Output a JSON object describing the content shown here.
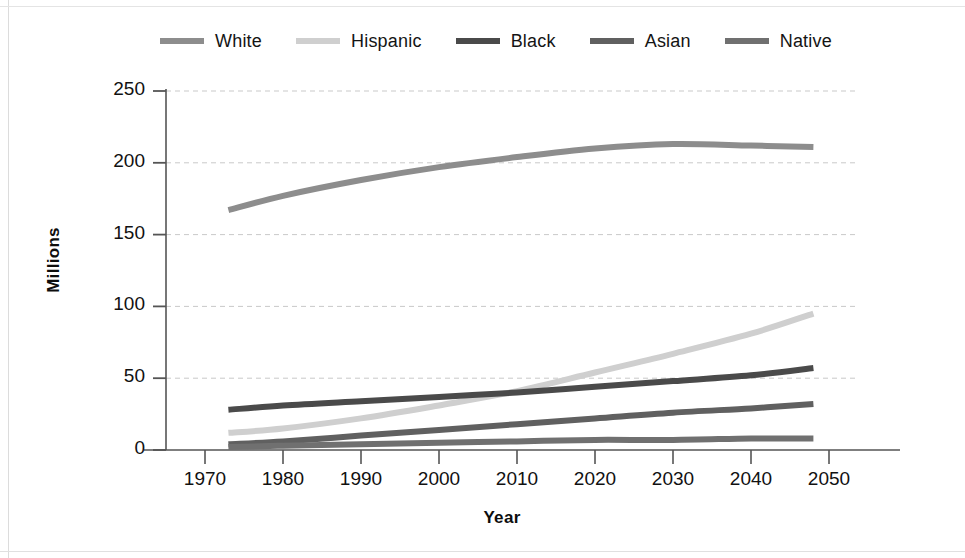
{
  "chart_data": {
    "type": "line",
    "title": "",
    "xlabel": "Year",
    "ylabel": "Millions",
    "xlim": [
      1965,
      2055
    ],
    "ylim": [
      0,
      250
    ],
    "yticks": [
      0,
      50,
      100,
      150,
      200,
      250
    ],
    "xticks": [
      1970,
      1980,
      1990,
      2000,
      2010,
      2020,
      2030,
      2040,
      2050
    ],
    "grid": "horizontal-dashed",
    "legend_position": "top",
    "x": [
      1973,
      1980,
      1990,
      2000,
      2010,
      2020,
      2030,
      2040,
      2048
    ],
    "series": [
      {
        "name": "White",
        "color": "#8d8d8d",
        "values": [
          167,
          177,
          188,
          197,
          204,
          210,
          213,
          212,
          211
        ]
      },
      {
        "name": "Hispanic",
        "color": "#cfcfcf",
        "values": [
          12,
          15,
          22,
          31,
          41,
          54,
          67,
          81,
          95
        ]
      },
      {
        "name": "Black",
        "color": "#4a4a4a",
        "values": [
          28,
          31,
          34,
          37,
          40,
          44,
          48,
          52,
          57
        ]
      },
      {
        "name": "Asian",
        "color": "#606060",
        "values": [
          4,
          6,
          10,
          14,
          18,
          22,
          26,
          29,
          32
        ]
      },
      {
        "name": "Native",
        "color": "#707070",
        "values": [
          2,
          3,
          4,
          5,
          6,
          7,
          7,
          8,
          8
        ]
      }
    ],
    "ytick_labels": [
      "0",
      "50",
      "100",
      "150",
      "200",
      "250"
    ],
    "xtick_labels": [
      "1970",
      "1980",
      "1990",
      "2000",
      "2010",
      "2020",
      "2030",
      "2040",
      "2050"
    ]
  },
  "legend": {
    "items": [
      {
        "label": "White"
      },
      {
        "label": "Hispanic"
      },
      {
        "label": "Black"
      },
      {
        "label": "Asian"
      },
      {
        "label": "Native"
      }
    ]
  },
  "axes": {
    "y_title": "Millions",
    "x_title": "Year"
  }
}
